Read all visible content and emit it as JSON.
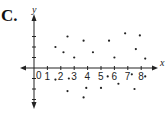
{
  "panel_label": "C.",
  "chart_data": {
    "type": "scatter",
    "title": "",
    "xlabel": "x",
    "ylabel": "y",
    "origin_label": "0",
    "x_ticks": [
      "1",
      "2",
      "3",
      "4",
      "5",
      "6",
      "7",
      "8"
    ],
    "xlim": [
      -2.2,
      9.4
    ],
    "ylim": [
      -3.7,
      3.8
    ],
    "grid": false,
    "points": [
      {
        "x": 1.6,
        "y": 2.0
      },
      {
        "x": 2.2,
        "y": 1.5
      },
      {
        "x": 2.5,
        "y": 3.0
      },
      {
        "x": 3.0,
        "y": 1.0
      },
      {
        "x": 3.7,
        "y": 2.6
      },
      {
        "x": 4.4,
        "y": 1.5
      },
      {
        "x": 5.6,
        "y": 2.6
      },
      {
        "x": 6.0,
        "y": 1.0
      },
      {
        "x": 6.8,
        "y": 3.3
      },
      {
        "x": 7.6,
        "y": 1.8
      },
      {
        "x": 7.9,
        "y": 3.1
      },
      {
        "x": 8.3,
        "y": 0.9
      },
      {
        "x": 1.6,
        "y": -1.1
      },
      {
        "x": 2.6,
        "y": -1.0
      },
      {
        "x": 2.5,
        "y": -2.2
      },
      {
        "x": 3.9,
        "y": -1.9
      },
      {
        "x": 3.7,
        "y": -2.8
      },
      {
        "x": 5.0,
        "y": -1.9
      },
      {
        "x": 5.5,
        "y": -0.8
      },
      {
        "x": 6.3,
        "y": -1.5
      },
      {
        "x": 7.3,
        "y": -0.6
      },
      {
        "x": 7.5,
        "y": -2.0
      },
      {
        "x": 8.3,
        "y": -0.8
      }
    ]
  }
}
